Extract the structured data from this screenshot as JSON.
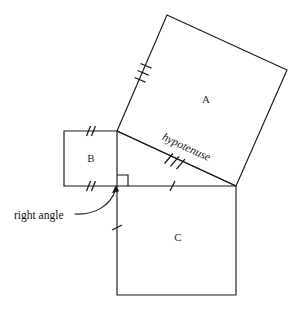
{
  "diagram": {
    "background_color": "#ffffff",
    "stroke_color": "#1b1b1b",
    "labels": {
      "square_a": "A",
      "square_b": "B",
      "square_c": "C",
      "hypotenuse": "hypotenuse",
      "right_angle": "right angle"
    },
    "geometry": {
      "triangle": {
        "right_angle_vertex": [
          117,
          186
        ],
        "apex_vertex": [
          117,
          131
        ],
        "right_vertex": [
          236,
          186
        ],
        "legs": [
          "vertical-left",
          "horizontal-bottom"
        ],
        "hypotenuse_endpoints": [
          [
            117,
            131
          ],
          [
            236,
            186
          ]
        ]
      },
      "square_a": {
        "on_side": "hypotenuse",
        "vertices": [
          [
            117,
            131
          ],
          [
            167,
            15
          ],
          [
            287,
            70
          ],
          [
            236,
            186
          ]
        ],
        "tick_count": 3
      },
      "square_b": {
        "on_side": "vertical-leg",
        "vertices": [
          [
            64,
            131
          ],
          [
            117,
            131
          ],
          [
            117,
            186
          ],
          [
            64,
            186
          ]
        ],
        "tick_count": 2
      },
      "square_c": {
        "on_side": "horizontal-leg",
        "vertices": [
          [
            117,
            186
          ],
          [
            236,
            186
          ],
          [
            236,
            295
          ],
          [
            117,
            295
          ]
        ],
        "tick_count": 1
      },
      "right_angle_marker": {
        "corner": [
          117,
          186
        ],
        "size": 11
      }
    },
    "tick_marks": {
      "hypotenuse_ticks": 3,
      "square_a_left_edge_ticks": 3,
      "square_b_top_ticks": 2,
      "square_b_bottom_ticks": 2,
      "horizontal_leg_ticks": 1,
      "square_c_left_ticks": 1
    },
    "annotation_arrow": {
      "from": [
        108,
        212
      ],
      "to": [
        117,
        187
      ],
      "style": "curved-with-arrowhead"
    }
  }
}
